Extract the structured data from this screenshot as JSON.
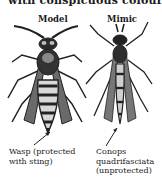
{
  "top_text_clipped": "with conspicuous colouring:",
  "labels": {
    "model": "Model",
    "mimic": "Mimic"
  },
  "captions": {
    "wasp_line1": "Wasp (protected",
    "wasp_line2": "with sting)",
    "mimic_line1": "Conops",
    "mimic_line2": "quadrifasciata",
    "mimic_line3": "(unprotected)"
  }
}
